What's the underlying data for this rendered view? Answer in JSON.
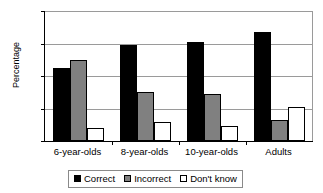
{
  "chart_data": {
    "type": "bar",
    "title": "",
    "xlabel": "",
    "ylabel": "Percentage",
    "ylim": [
      0,
      80
    ],
    "yticks": [
      0,
      20,
      40,
      60,
      80
    ],
    "grid": true,
    "legend_position": "bottom",
    "categories": [
      "6-year-olds",
      "8-year-olds",
      "10-year-olds",
      "Adults"
    ],
    "series": [
      {
        "name": "Correct",
        "color": "#000000",
        "values": [
          45,
          59,
          61,
          67
        ]
      },
      {
        "name": "Incorrect",
        "color": "#808080",
        "values": [
          50,
          30,
          29,
          13
        ]
      },
      {
        "name": "Don't know",
        "color": "#ffffff",
        "values": [
          8,
          12,
          9,
          21
        ]
      }
    ]
  },
  "axis": {
    "ytick_labels": [
      "80",
      "60",
      "40",
      "20",
      "0"
    ],
    "ylabel_text": "Percentage"
  },
  "legend": {
    "items": [
      {
        "label": "Correct"
      },
      {
        "label": "Incorrect"
      },
      {
        "label": "Don't know"
      }
    ]
  },
  "xaxis": {
    "labels": [
      "6-year-olds",
      "8-year-olds",
      "10-year-olds",
      "Adults"
    ]
  }
}
